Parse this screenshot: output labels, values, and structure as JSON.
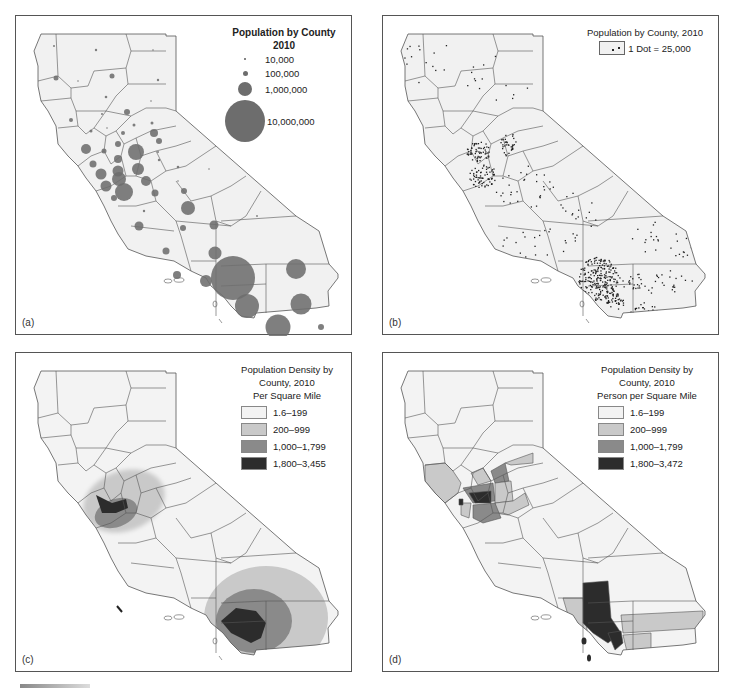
{
  "figure": {
    "colors": {
      "map_fill": "#f1f1f1",
      "county_line": "#555555",
      "symbol": "#6d6d6d",
      "class_1": "#f3f3f3",
      "class_2": "#c9c9c9",
      "class_3": "#8a8a8a",
      "class_4": "#2c2c2c"
    },
    "panels": [
      {
        "letter": "(a)",
        "type": "proportional-symbol",
        "legend": {
          "title": "Population by County 2010",
          "items": [
            {
              "label": "10,000",
              "size": 1.5
            },
            {
              "label": "100,000",
              "size": 5
            },
            {
              "label": "1,000,000",
              "size": 14
            },
            {
              "label": "10,000,000",
              "size": 42
            }
          ]
        }
      },
      {
        "letter": "(b)",
        "type": "dot-density",
        "legend": {
          "title": "Population by County, 2010",
          "key": "1 Dot = 25,000"
        }
      },
      {
        "letter": "(c)",
        "type": "isopleth",
        "legend": {
          "title_lines": [
            "Population Density by",
            "County, 2010",
            "Per Square Mile"
          ],
          "classes": [
            {
              "label": "1.6–199",
              "color": "#f3f3f3"
            },
            {
              "label": "200–999",
              "color": "#c9c9c9"
            },
            {
              "label": "1,000–1,799",
              "color": "#8a8a8a"
            },
            {
              "label": "1,800–3,455",
              "color": "#2c2c2c"
            }
          ]
        }
      },
      {
        "letter": "(d)",
        "type": "choropleth",
        "legend": {
          "title_lines": [
            "Population Density by",
            "County, 2010",
            "Person per Square Mile"
          ],
          "classes": [
            {
              "label": "1.6–199",
              "color": "#f3f3f3"
            },
            {
              "label": "200–999",
              "color": "#c9c9c9"
            },
            {
              "label": "1,000–1,799",
              "color": "#8a8a8a"
            },
            {
              "label": "1,800–3,472",
              "color": "#2c2c2c"
            }
          ]
        }
      }
    ]
  }
}
